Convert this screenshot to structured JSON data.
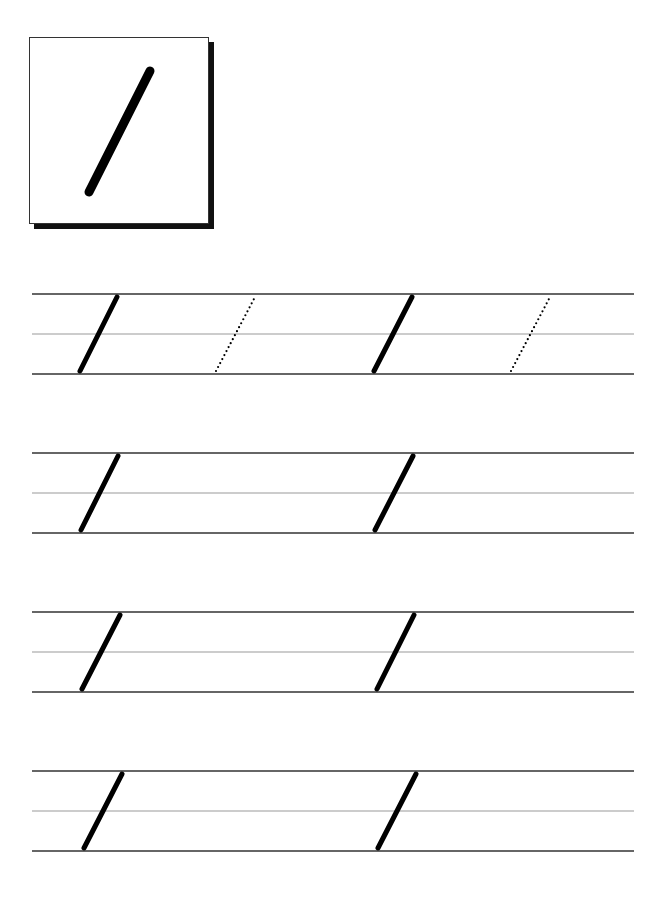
{
  "page": {
    "type": "handwriting-practice-worksheet",
    "background_color": "#ffffff",
    "ink_color": "#000000",
    "guide_line_color": "#333333",
    "midline_color": "#999999"
  },
  "model_stroke": {
    "symbol": "/",
    "label": "diagonal-stroke",
    "icon": "slash-stroke-icon"
  },
  "practice_rows": [
    {
      "top": 294,
      "mid": 334,
      "bottom": 374,
      "strokes": [
        {
          "x1": 80,
          "x2": 117,
          "style": "solid"
        },
        {
          "x1": 216,
          "x2": 255,
          "style": "dotted"
        },
        {
          "x1": 374,
          "x2": 412,
          "style": "solid"
        },
        {
          "x1": 511,
          "x2": 550,
          "style": "dotted"
        }
      ]
    },
    {
      "top": 453,
      "mid": 493,
      "bottom": 533,
      "strokes": [
        {
          "x1": 81,
          "x2": 118,
          "style": "solid"
        },
        {
          "x1": 375,
          "x2": 413,
          "style": "solid"
        }
      ]
    },
    {
      "top": 612,
      "mid": 652,
      "bottom": 692,
      "strokes": [
        {
          "x1": 82,
          "x2": 120,
          "style": "solid"
        },
        {
          "x1": 377,
          "x2": 414,
          "style": "solid"
        }
      ]
    },
    {
      "top": 771,
      "mid": 811,
      "bottom": 851,
      "strokes": [
        {
          "x1": 84,
          "x2": 122,
          "style": "solid"
        },
        {
          "x1": 378,
          "x2": 416,
          "style": "solid"
        }
      ]
    }
  ]
}
